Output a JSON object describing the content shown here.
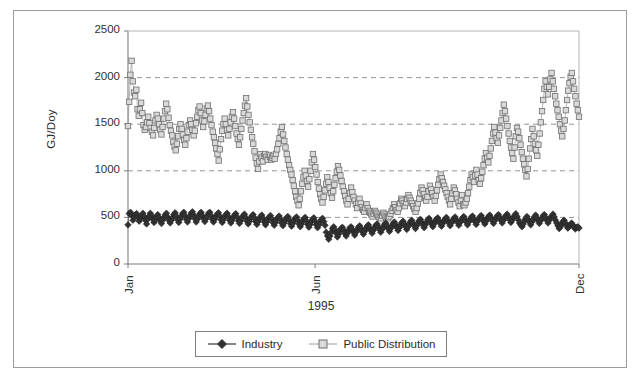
{
  "chart_data": {
    "type": "line",
    "title": "",
    "subtitle": "",
    "xlabel": "1995",
    "ylabel": "GJ/Doy",
    "ylim": [
      0,
      2500
    ],
    "yticks": [
      0,
      500,
      1000,
      1500,
      2000,
      2500
    ],
    "ytick_labels": [
      "0",
      "500",
      "1000",
      "1500",
      "2000",
      "2500"
    ],
    "xticks": [
      0,
      151,
      364
    ],
    "xtick_labels": [
      "Jan",
      "Jun",
      "Dec"
    ],
    "xlim": [
      0,
      364
    ],
    "grid": "horizontal dashed gridlines at 500, 1000, 1500, 2000",
    "legend_position": "bottom-center",
    "marker_style": {
      "Industry": "filled-diamond",
      "Public Distribution": "open-square"
    },
    "colors": {
      "industry": "#333333",
      "public_distribution": "#9a9a9a",
      "public_distribution_fill": "#d9d9d9",
      "gridline": "#8a8a8a",
      "axis": "#7d7d7d",
      "frame": "#9a9a9a",
      "text": "#2b2b2b",
      "background": "#ffffff"
    },
    "series": [
      {
        "name": "Industry",
        "marker": "filled-diamond",
        "color": "#333333",
        "values": [
          420,
          540,
          555,
          520,
          470,
          505,
          530,
          540,
          500,
          460,
          490,
          520,
          545,
          510,
          470,
          430,
          480,
          515,
          545,
          520,
          480,
          445,
          475,
          505,
          530,
          500,
          465,
          435,
          470,
          500,
          525,
          545,
          505,
          470,
          440,
          470,
          500,
          530,
          550,
          515,
          475,
          445,
          480,
          510,
          540,
          555,
          520,
          480,
          450,
          485,
          515,
          545,
          560,
          525,
          485,
          450,
          480,
          510,
          540,
          555,
          520,
          485,
          455,
          485,
          515,
          545,
          555,
          520,
          480,
          450,
          480,
          510,
          535,
          550,
          515,
          475,
          445,
          475,
          505,
          530,
          545,
          510,
          470,
          440,
          470,
          500,
          525,
          540,
          505,
          465,
          435,
          465,
          495,
          520,
          535,
          500,
          460,
          430,
          460,
          490,
          515,
          530,
          495,
          455,
          425,
          455,
          485,
          510,
          525,
          490,
          450,
          420,
          450,
          480,
          505,
          520,
          485,
          445,
          415,
          445,
          475,
          500,
          515,
          480,
          440,
          410,
          440,
          470,
          495,
          510,
          475,
          435,
          405,
          435,
          465,
          490,
          505,
          470,
          430,
          400,
          430,
          460,
          485,
          500,
          465,
          425,
          395,
          425,
          455,
          480,
          495,
          460,
          420,
          390,
          420,
          450,
          475,
          490,
          455,
          415,
          340,
          300,
          265,
          300,
          340,
          380,
          400,
          370,
          330,
          290,
          320,
          355,
          380,
          395,
          365,
          330,
          300,
          330,
          360,
          385,
          400,
          370,
          340,
          310,
          340,
          370,
          395,
          410,
          380,
          350,
          320,
          350,
          380,
          405,
          420,
          390,
          360,
          330,
          360,
          390,
          415,
          430,
          400,
          370,
          340,
          370,
          400,
          425,
          440,
          410,
          380,
          350,
          380,
          410,
          435,
          450,
          420,
          390,
          360,
          390,
          420,
          445,
          460,
          430,
          400,
          370,
          400,
          430,
          455,
          470,
          440,
          410,
          380,
          410,
          440,
          465,
          480,
          450,
          420,
          390,
          420,
          450,
          475,
          490,
          460,
          430,
          400,
          430,
          460,
          480,
          495,
          465,
          435,
          405,
          435,
          465,
          485,
          500,
          470,
          440,
          410,
          440,
          465,
          490,
          505,
          475,
          445,
          415,
          445,
          470,
          495,
          510,
          480,
          450,
          420,
          450,
          475,
          500,
          515,
          485,
          455,
          425,
          455,
          485,
          505,
          520,
          490,
          460,
          430,
          460,
          490,
          510,
          525,
          495,
          465,
          435,
          465,
          495,
          515,
          530,
          500,
          470,
          440,
          470,
          500,
          520,
          535,
          505,
          475,
          445,
          470,
          500,
          520,
          540,
          510,
          475,
          440,
          420,
          400,
          430,
          465,
          490,
          510,
          480,
          450,
          420,
          450,
          480,
          505,
          525,
          495,
          465,
          435,
          465,
          490,
          515,
          530,
          500,
          470,
          440,
          470,
          495,
          515,
          535,
          505,
          470,
          440,
          410,
          380,
          400,
          430,
          455,
          470,
          440,
          410,
          385,
          400,
          420,
          440,
          420,
          395,
          375,
          390,
          400,
          385
        ]
      },
      {
        "name": "Public Distribution",
        "marker": "open-square",
        "color": "#9a9a9a",
        "values": [
          1480,
          1740,
          2030,
          2180,
          1960,
          1840,
          1800,
          1870,
          1660,
          1590,
          1660,
          1730,
          1620,
          1490,
          1440,
          1470,
          1520,
          1580,
          1510,
          1460,
          1420,
          1380,
          1460,
          1540,
          1600,
          1560,
          1500,
          1440,
          1390,
          1470,
          1560,
          1640,
          1720,
          1660,
          1570,
          1490,
          1430,
          1380,
          1310,
          1260,
          1220,
          1290,
          1370,
          1450,
          1500,
          1450,
          1390,
          1330,
          1280,
          1350,
          1420,
          1490,
          1540,
          1500,
          1440,
          1380,
          1430,
          1510,
          1580,
          1650,
          1690,
          1620,
          1540,
          1470,
          1530,
          1600,
          1670,
          1700,
          1640,
          1560,
          1490,
          1420,
          1360,
          1300,
          1240,
          1180,
          1110,
          1230,
          1340,
          1430,
          1500,
          1560,
          1500,
          1440,
          1380,
          1450,
          1520,
          1580,
          1630,
          1560,
          1480,
          1400,
          1340,
          1280,
          1360,
          1450,
          1540,
          1620,
          1700,
          1780,
          1690,
          1600,
          1520,
          1440,
          1360,
          1290,
          1210,
          1140,
          1080,
          1020,
          1100,
          1180,
          1140,
          1100,
          1160,
          1180,
          1150,
          1120,
          1170,
          1150,
          1120,
          1140,
          1160,
          1130,
          1180,
          1230,
          1290,
          1350,
          1420,
          1470,
          1390,
          1320,
          1250,
          1180,
          1120,
          1060,
          1010,
          960,
          900,
          840,
          780,
          720,
          680,
          630,
          700,
          780,
          860,
          930,
          1000,
          950,
          890,
          830,
          910,
          1000,
          1090,
          1180,
          1120,
          1040,
          960,
          880,
          810,
          750,
          700,
          660,
          720,
          790,
          860,
          930,
          880,
          820,
          760,
          710,
          780,
          850,
          920,
          990,
          1050,
          1010,
          950,
          890,
          830,
          780,
          730,
          680,
          640,
          700,
          760,
          820,
          770,
          720,
          680,
          640,
          600,
          660,
          700,
          650,
          610,
          580,
          560,
          600,
          640,
          600,
          570,
          550,
          530,
          510,
          540,
          570,
          550,
          530,
          510,
          500,
          490,
          520,
          550,
          530,
          510,
          500,
          490,
          510,
          540,
          570,
          600,
          640,
          610,
          580,
          560,
          600,
          650,
          700,
          680,
          650,
          620,
          660,
          700,
          740,
          710,
          680,
          650,
          620,
          590,
          560,
          600,
          650,
          700,
          760,
          820,
          790,
          750,
          710,
          680,
          720,
          780,
          840,
          800,
          760,
          720,
          680,
          730,
          790,
          850,
          910,
          960,
          920,
          880,
          840,
          800,
          760,
          720,
          680,
          640,
          700,
          760,
          820,
          790,
          750,
          700,
          660,
          620,
          680,
          740,
          640,
          630,
          660,
          700,
          760,
          830,
          900,
          960,
          930,
          880,
          950,
          1010,
          960,
          900,
          860,
          920,
          990,
          1060,
          1130,
          1190,
          1140,
          1090,
          1160,
          1240,
          1320,
          1400,
          1470,
          1410,
          1350,
          1300,
          1380,
          1460,
          1540,
          1620,
          1710,
          1640,
          1560,
          1480,
          1400,
          1320,
          1250,
          1190,
          1130,
          1250,
          1370,
          1460,
          1420,
          1350,
          1280,
          1200,
          1130,
          1070,
          1010,
          940,
          1020,
          1130,
          1240,
          1340,
          1450,
          1370,
          1290,
          1220,
          1160,
          1280,
          1400,
          1520,
          1640,
          1760,
          1880,
          1960,
          1900,
          1820,
          1900,
          1980,
          2050,
          1960,
          1880,
          1800,
          1720,
          1650,
          1580,
          1500,
          1430,
          1370,
          1450,
          1540,
          1650,
          1760,
          1860,
          1940,
          2010,
          2050,
          1960,
          1880,
          1800,
          1720,
          1650,
          1580
        ]
      }
    ]
  },
  "axis": {
    "y_title": "GJ/Doy",
    "x_title": "1995"
  },
  "legend": {
    "entries": [
      {
        "label": "Industry",
        "marker": "filled-diamond-icon"
      },
      {
        "label": "Public Distribution",
        "marker": "open-square-icon"
      }
    ]
  }
}
